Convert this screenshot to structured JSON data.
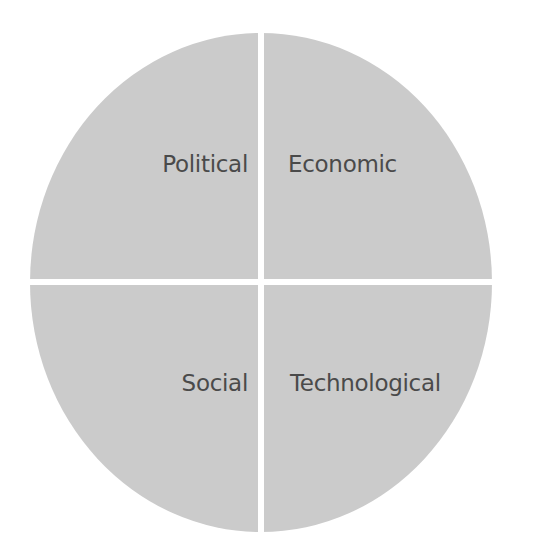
{
  "diagram": {
    "type": "PEST quadrant circle",
    "fill_color": "#cbcbcb",
    "text_color": "#4a4a4a",
    "quadrants": [
      {
        "position": "top-left",
        "label": "Political"
      },
      {
        "position": "top-right",
        "label": "Economic"
      },
      {
        "position": "bottom-left",
        "label": "Social"
      },
      {
        "position": "bottom-right",
        "label": "Technological"
      }
    ]
  }
}
